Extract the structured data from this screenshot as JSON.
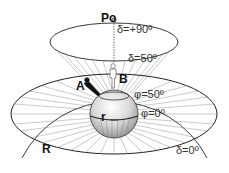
{
  "diagram": {
    "labels": {
      "pole": "Po",
      "dec_90": "δ=+90º",
      "dec_50": "δ=50º",
      "observer_a": "A",
      "observer_b": "B",
      "lat_50": "φ=50º",
      "lat_0": "φ=0º",
      "earth_radius": "r",
      "sphere_radius": "R",
      "dec_0": "δ=0º"
    },
    "colors": {
      "line": "#222222",
      "ray": "#888888",
      "earth_light": "#f2f2f2",
      "earth_dark": "#9a9a9a"
    }
  }
}
